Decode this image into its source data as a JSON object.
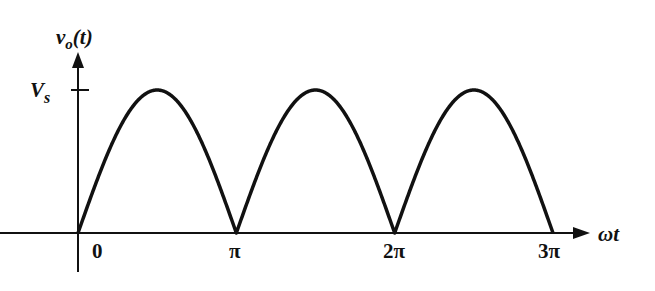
{
  "diagram": {
    "y_axis_label": "v_o(t)",
    "y_axis_label_main": "v",
    "y_axis_label_sub": "o",
    "y_axis_label_arg": "(t)",
    "x_axis_label": "ωt",
    "peak_label_main": "V",
    "peak_label_sub": "s",
    "x_ticks": [
      "0",
      "π",
      "2π",
      "3π"
    ],
    "stroke_color": "#111111"
  },
  "chart_data": {
    "type": "line",
    "title": "",
    "xlabel": "ωt",
    "ylabel": "v_o(t)",
    "x_ticks": [
      "0",
      "π",
      "2π",
      "3π"
    ],
    "y_ticks": [
      "V_s"
    ],
    "series": [
      {
        "name": "v_o(t) = V_s|sin(ωt)|",
        "x": [
          0,
          0.5,
          1,
          1.5,
          2,
          2.5,
          3
        ],
        "x_units": "π rad",
        "values": [
          0,
          1,
          0,
          1,
          0,
          1,
          0
        ],
        "values_units": "V_s"
      }
    ],
    "xlim": [
      0,
      3
    ],
    "ylim": [
      0,
      1
    ],
    "grid": false
  }
}
